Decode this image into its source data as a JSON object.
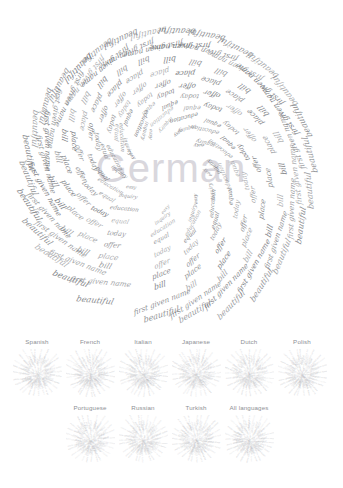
{
  "figure": {
    "title": "German",
    "watermark": "German",
    "type": "spiral-word-cloud",
    "center": {
      "x": 171,
      "y": 168
    },
    "ring_words": [
      "beautiful",
      "first given name",
      "bill",
      "place",
      "offer",
      "today",
      "equal",
      "education",
      "inquiry",
      "easy"
    ],
    "rings": [
      {
        "index": 0,
        "word": "easy",
        "radius": 22,
        "count": 8,
        "font_size": 4.6
      },
      {
        "index": 1,
        "word": "inquiry",
        "radius": 34,
        "count": 11,
        "font_size": 5.2
      },
      {
        "index": 2,
        "word": "education",
        "radius": 46,
        "count": 13,
        "font_size": 5.8
      },
      {
        "index": 3,
        "word": "equal",
        "radius": 58,
        "count": 16,
        "font_size": 6.2
      },
      {
        "index": 4,
        "word": "today",
        "radius": 70,
        "count": 18,
        "font_size": 6.6
      },
      {
        "index": 5,
        "word": "offer",
        "radius": 83,
        "count": 20,
        "font_size": 7.0
      },
      {
        "index": 6,
        "word": "place",
        "radius": 96,
        "count": 22,
        "font_size": 7.4
      },
      {
        "index": 7,
        "word": "bill",
        "radius": 109,
        "count": 25,
        "font_size": 7.8
      },
      {
        "index": 8,
        "word": "first given name",
        "radius": 122,
        "count": 26,
        "font_size": 7.4
      },
      {
        "index": 9,
        "word": "beautiful",
        "radius": 137,
        "count": 28,
        "font_size": 8.2
      }
    ],
    "colors": {
      "word": "#6f7276",
      "watermark": "#d9d7dd",
      "thumb_word": "#c3c4c8",
      "label": "#8d9095",
      "background": "#ffffff"
    }
  },
  "thumbnails": {
    "rows": [
      {
        "row": 1,
        "items": [
          {
            "label": "Spanish",
            "cx": 37,
            "seed": 11
          },
          {
            "label": "French",
            "cx": 90,
            "seed": 23
          },
          {
            "label": "Italian",
            "cx": 143,
            "seed": 37
          },
          {
            "label": "Japanese",
            "cx": 196,
            "seed": 49
          },
          {
            "label": "Dutch",
            "cx": 249,
            "seed": 61
          },
          {
            "label": "Polish",
            "cx": 302,
            "seed": 73
          }
        ]
      },
      {
        "row": 2,
        "items": [
          {
            "label": "Portuguese",
            "cx": 90,
            "seed": 89
          },
          {
            "label": "Russian",
            "cx": 143,
            "seed": 101
          },
          {
            "label": "Turkish",
            "cx": 196,
            "seed": 113
          },
          {
            "label": "All languages",
            "cx": 249,
            "seed": 127
          }
        ]
      }
    ],
    "burst_words": [
      "beautiful",
      "bill",
      "place",
      "offer",
      "today",
      "equal",
      "first given name",
      "education",
      "inquiry",
      "easy"
    ]
  }
}
